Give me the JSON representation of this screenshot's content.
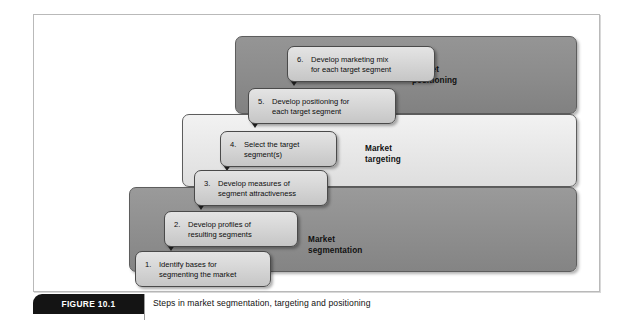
{
  "figure": {
    "tab_label": "FIGURE 10.1",
    "caption": "Steps in market segmentation, targeting and positioning"
  },
  "bands": [
    {
      "id": "positioning",
      "label": "Market\npositioning",
      "color": "#8b8b8b"
    },
    {
      "id": "targeting",
      "label": "Market\ntargeting",
      "color": "#e7e7e7"
    },
    {
      "id": "segmentation",
      "label": "Market\nsegmentation",
      "color": "#8e8e8e"
    }
  ],
  "steps": [
    {
      "number": "1.",
      "text": "Identify bases for\nsegmenting the market"
    },
    {
      "number": "2.",
      "text": "Develop profiles of\nresulting segments"
    },
    {
      "number": "3.",
      "text": "Develop measures of\nsegment attractiveness"
    },
    {
      "number": "4.",
      "text": "Select the target\nsegment(s)"
    },
    {
      "number": "5.",
      "text": "Develop positioning for\neach target segment"
    },
    {
      "number": "6.",
      "text": "Develop marketing mix\nfor each target segment"
    }
  ]
}
